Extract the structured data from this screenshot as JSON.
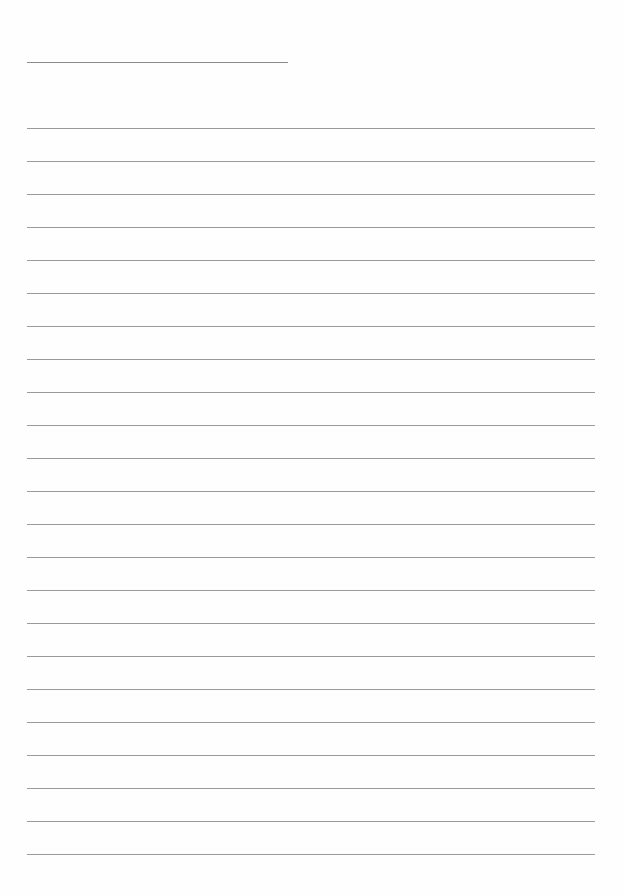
{
  "document": {
    "type": "lined-paper",
    "title_line": {
      "x": 27,
      "y": 62,
      "width": 261
    },
    "rules": {
      "count": 23,
      "start_y": 128,
      "spacing": 33,
      "x": 27,
      "width": 568
    },
    "colors": {
      "paper": "#fefefe",
      "rule": "#9a9a9a",
      "title_rule": "#8a8a8a"
    }
  }
}
